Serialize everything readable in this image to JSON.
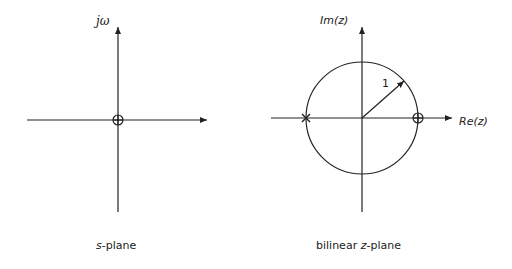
{
  "s_plane": {
    "vertical_axis_label": "jω",
    "caption_var": "s",
    "caption_rest": "-plane",
    "markers": [
      {
        "type": "zero",
        "symbol": "circle-plus",
        "position": "origin"
      }
    ]
  },
  "z_plane": {
    "vertical_axis_label": "Im(z)",
    "horizontal_axis_label": "Re(z)",
    "radius_label": "1",
    "caption_pre": "bilinear ",
    "caption_var": "z",
    "caption_rest": "-plane",
    "markers": [
      {
        "type": "pole",
        "symbol": "x",
        "position": "z=-1"
      },
      {
        "type": "zero",
        "symbol": "circle-plus",
        "position": "z=1"
      }
    ]
  },
  "colors": {
    "line": "#222222",
    "background": "#ffffff"
  }
}
